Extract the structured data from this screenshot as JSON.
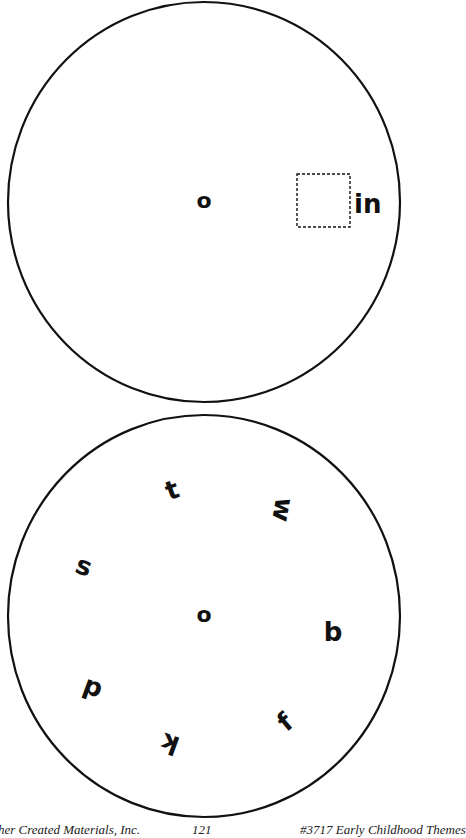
{
  "top_wheel": {
    "center_letter": "o",
    "blank_box": "",
    "ending": "in"
  },
  "bottom_wheel": {
    "center_letter": "o",
    "letters": [
      {
        "char": "t",
        "x": 172,
        "y": 490,
        "rot": -20
      },
      {
        "char": "w",
        "x": 283,
        "y": 510,
        "rot": 100
      },
      {
        "char": "s",
        "x": 84,
        "y": 566,
        "rot": 20
      },
      {
        "char": "b",
        "x": 333,
        "y": 632,
        "rot": 0
      },
      {
        "char": "d",
        "x": 92,
        "y": 690,
        "rot": 200
      },
      {
        "char": "f",
        "x": 285,
        "y": 722,
        "rot": -40
      },
      {
        "char": "k",
        "x": 170,
        "y": 744,
        "rot": 200
      }
    ]
  },
  "footer": {
    "publisher": "©Teacher Created Materials, Inc.",
    "page_number": "121",
    "book": "#3717 Early Childhood Themes"
  }
}
